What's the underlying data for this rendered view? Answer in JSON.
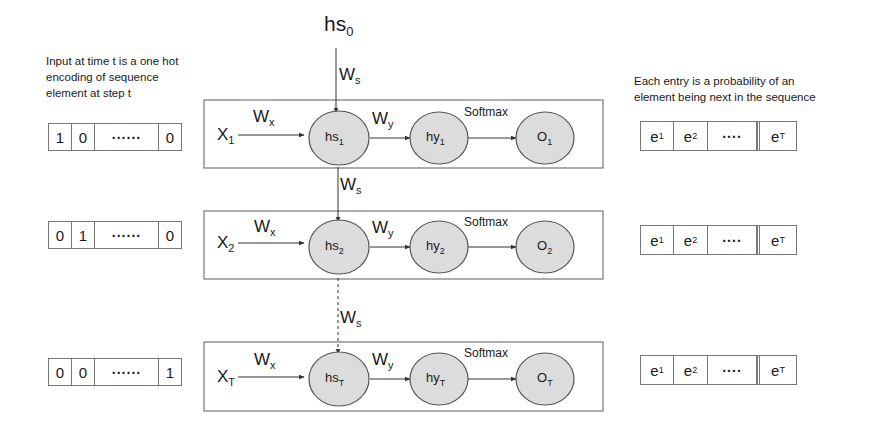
{
  "initial_state": {
    "base": "hs",
    "sub": "0"
  },
  "notes": {
    "input": [
      "Input at time t is a one hot",
      "encoding of sequence",
      "element at step t"
    ],
    "output": [
      "Each entry is a probability of an",
      "element being next in the sequence"
    ]
  },
  "weights": {
    "x": {
      "base": "W",
      "sub": "x"
    },
    "y": {
      "base": "W",
      "sub": "y"
    },
    "s": {
      "base": "W",
      "sub": "s"
    }
  },
  "softmax_label": "Softmax",
  "rows": [
    {
      "input_vector": [
        "1",
        "0",
        "......",
        "0"
      ],
      "x": {
        "base": "X",
        "sub": "1"
      },
      "hs": {
        "base": "hs",
        "sub": "1"
      },
      "hy": {
        "base": "hy",
        "sub": "1"
      },
      "o": {
        "base": "O",
        "sub": "1"
      },
      "output_vector": [
        {
          "base": "e",
          "sub": "1"
        },
        {
          "base": "e",
          "sub": "2"
        },
        {
          "base": "....",
          "sub": ""
        },
        {
          "base": "e",
          "sub": "T"
        }
      ]
    },
    {
      "input_vector": [
        "0",
        "1",
        "......",
        "0"
      ],
      "x": {
        "base": "X",
        "sub": "2"
      },
      "hs": {
        "base": "hs",
        "sub": "2"
      },
      "hy": {
        "base": "hy",
        "sub": "2"
      },
      "o": {
        "base": "O",
        "sub": "2"
      },
      "output_vector": [
        {
          "base": "e",
          "sub": "1"
        },
        {
          "base": "e",
          "sub": "2"
        },
        {
          "base": "....",
          "sub": ""
        },
        {
          "base": "e",
          "sub": "T"
        }
      ]
    },
    {
      "input_vector": [
        "0",
        "0",
        "......",
        "1"
      ],
      "x": {
        "base": "X",
        "sub": "T"
      },
      "hs": {
        "base": "hs",
        "sub": "T"
      },
      "hy": {
        "base": "hy",
        "sub": "T"
      },
      "o": {
        "base": "O",
        "sub": "T"
      },
      "output_vector": [
        {
          "base": "e",
          "sub": "1"
        },
        {
          "base": "e",
          "sub": "2"
        },
        {
          "base": "....",
          "sub": ""
        },
        {
          "base": "e",
          "sub": "T"
        }
      ]
    }
  ],
  "colors": {
    "node_fill": "#dcdcdc",
    "stroke": "#555555",
    "box_stroke": "#777777"
  }
}
